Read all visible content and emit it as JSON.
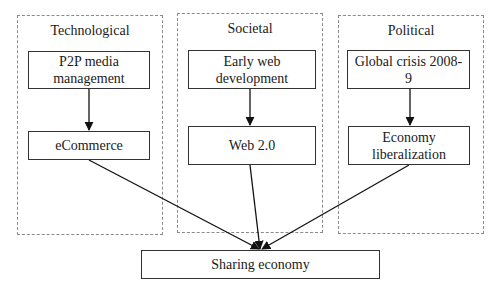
{
  "groups": [
    {
      "id": "technological",
      "title": "Technological"
    },
    {
      "id": "societal",
      "title": "Societal"
    },
    {
      "id": "political",
      "title": "Political"
    }
  ],
  "nodes": {
    "p2p": "P2P media management",
    "p2p_line1": "P2P media",
    "p2p_line2": "management",
    "ecommerce": "eCommerce",
    "early_web_line1": "Early web",
    "early_web_line2": "development",
    "web2": "Web 2.0",
    "crisis": "Global crisis 2008-9",
    "liberal_line1": "Economy",
    "liberal_line2": "liberalization",
    "sharing": "Sharing economy"
  },
  "edges": [
    {
      "from": "P2P media management",
      "to": "eCommerce"
    },
    {
      "from": "Early web development",
      "to": "Web 2.0"
    },
    {
      "from": "Global crisis 2008-9",
      "to": "Economy liberalization"
    },
    {
      "from": "eCommerce",
      "to": "Sharing economy"
    },
    {
      "from": "Web 2.0",
      "to": "Sharing economy"
    },
    {
      "from": "Economy liberalization",
      "to": "Sharing economy"
    }
  ]
}
